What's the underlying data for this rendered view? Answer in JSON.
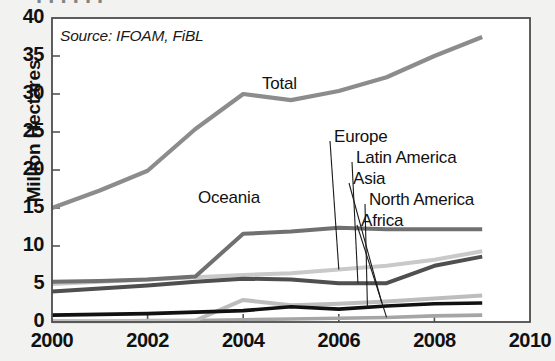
{
  "figure": {
    "source_note": "Source: IFOAM, FiBL",
    "ylabel": "Million Hectares",
    "background": "#f2f2f1",
    "plot_background": "#ffffff",
    "frame_color": "#4d4d4d"
  },
  "axes": {
    "y_ticks": [
      "40",
      "35",
      "30",
      "25",
      "20",
      "15",
      "10",
      "5",
      "0"
    ],
    "x_ticks": [
      "2000",
      "2002",
      "2004",
      "2006",
      "2008",
      "2010"
    ]
  },
  "annotations": {
    "total": "Total",
    "oceania": "Oceania",
    "europe": "Europe",
    "latin_america": "Latin America",
    "asia": "Asia",
    "north_america": "North America",
    "africa": "Africa"
  },
  "chart_data": {
    "type": "line",
    "title": "",
    "subtitle": "",
    "xlabel": "",
    "ylabel": "Million Hectares",
    "source": "Source: IFOAM, FiBL",
    "xlim": [
      2000,
      2010
    ],
    "ylim": [
      0,
      40
    ],
    "x_ticks": [
      2000,
      2002,
      2004,
      2006,
      2008,
      2010
    ],
    "y_ticks": [
      0,
      5,
      10,
      15,
      20,
      25,
      30,
      35,
      40
    ],
    "grid": false,
    "legend": "inline-labels-with-leader-lines",
    "x": [
      2000,
      2001,
      2002,
      2003,
      2004,
      2005,
      2006,
      2007,
      2008,
      2009
    ],
    "series": [
      {
        "name": "Total",
        "color": "#8c8c8c",
        "width": 4.2,
        "values": [
          15.0,
          17.3,
          19.9,
          25.4,
          30.0,
          29.2,
          30.4,
          32.2,
          35.0,
          37.5
        ]
      },
      {
        "name": "Oceania",
        "color": "#707070",
        "width": 4.0,
        "values": [
          5.3,
          5.4,
          5.6,
          6.0,
          11.6,
          11.9,
          12.4,
          12.2,
          12.2,
          12.2
        ]
      },
      {
        "name": "Europe",
        "color": "#c9c9c9",
        "width": 4.0,
        "values": [
          5.0,
          5.3,
          5.6,
          5.9,
          6.2,
          6.4,
          6.9,
          7.4,
          8.2,
          9.3
        ]
      },
      {
        "name": "Latin America",
        "color": "#4f4f4f",
        "width": 4.0,
        "values": [
          4.0,
          4.4,
          4.8,
          5.3,
          5.7,
          5.6,
          5.1,
          5.1,
          7.4,
          8.6
        ]
      },
      {
        "name": "Asia",
        "color": "#bdbdbd",
        "width": 4.0,
        "values": [
          0.1,
          0.1,
          0.1,
          0.2,
          2.9,
          2.2,
          2.4,
          2.7,
          3.1,
          3.5
        ]
      },
      {
        "name": "North America",
        "color": "#111111",
        "width": 3.6,
        "values": [
          0.9,
          1.0,
          1.1,
          1.3,
          1.5,
          2.0,
          1.7,
          2.1,
          2.4,
          2.5
        ]
      },
      {
        "name": "Africa",
        "color": "#a5a5a5",
        "width": 3.6,
        "values": [
          0.1,
          0.1,
          0.2,
          0.2,
          0.3,
          0.4,
          0.5,
          0.6,
          0.8,
          0.9
        ]
      }
    ]
  }
}
